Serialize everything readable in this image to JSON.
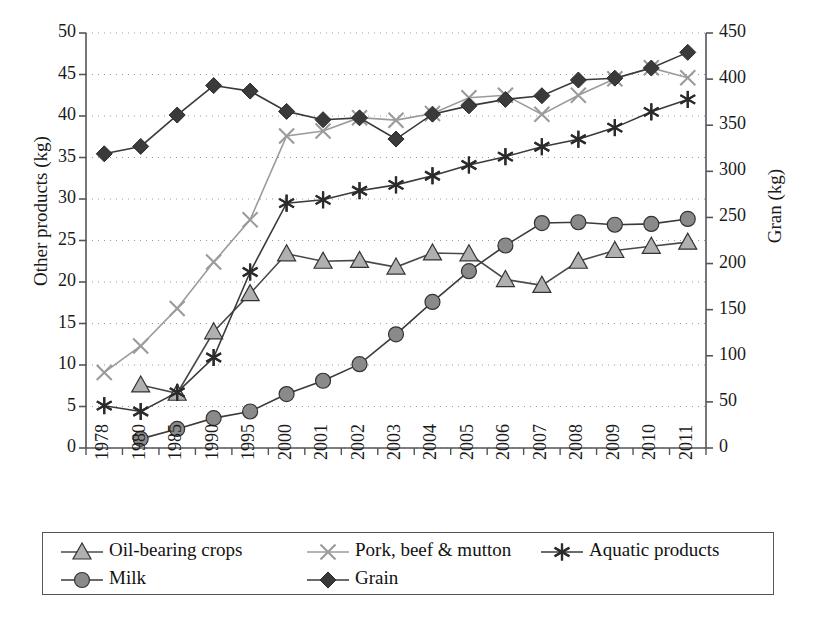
{
  "chart_data": {
    "type": "line",
    "title": "",
    "xlabel": "",
    "ylabel": "Other products (kg)",
    "y2label": "Gran (kg)",
    "ylim": [
      0,
      50
    ],
    "y2lim": [
      0,
      450
    ],
    "yticks": [
      "0",
      "5",
      "10",
      "15",
      "20",
      "25",
      "30",
      "35",
      "40",
      "45",
      "50"
    ],
    "y2ticks": [
      "0",
      "50",
      "100",
      "150",
      "200",
      "250",
      "300",
      "350",
      "400",
      "450"
    ],
    "grid": true,
    "legend_position": "bottom",
    "categories": [
      "1978",
      "1980",
      "1985",
      "1990",
      "1995",
      "2000",
      "2001",
      "2002",
      "2003",
      "2004",
      "2005",
      "2006",
      "2007",
      "2008",
      "2009",
      "2010",
      "2011"
    ],
    "series": [
      {
        "name": "Oil-bearing crops",
        "axis": "left",
        "marker": "triangle",
        "color": "#b0b0b0",
        "line_color": "#4a4a4a",
        "values": [
          null,
          7.6,
          6.6,
          14.0,
          18.6,
          23.4,
          22.5,
          22.6,
          21.8,
          23.5,
          23.4,
          20.3,
          19.6,
          22.5,
          23.8,
          24.3,
          24.8
        ]
      },
      {
        "name": "Pork, beef & mutton",
        "axis": "left",
        "marker": "x",
        "color": "#9b9b9b",
        "line_color": "#9b9b9b",
        "values": [
          9.1,
          12.3,
          16.8,
          22.4,
          27.5,
          37.6,
          38.2,
          39.8,
          39.5,
          40.3,
          42.2,
          42.5,
          40.2,
          42.5,
          44.5,
          45.8,
          44.6
        ]
      },
      {
        "name": "Aquatic products",
        "axis": "left",
        "marker": "asterisk",
        "color": "#2b2b2b",
        "line_color": "#3a3a3a",
        "values": [
          5.1,
          4.4,
          6.7,
          10.9,
          21.2,
          29.5,
          29.9,
          31.0,
          31.7,
          32.8,
          34.1,
          35.1,
          36.3,
          37.2,
          38.6,
          40.5,
          42.0
        ]
      },
      {
        "name": "Milk",
        "axis": "left",
        "marker": "circle",
        "color": "#8a8a8a",
        "line_color": "#3a3a3a",
        "values": [
          null,
          1.1,
          2.3,
          3.6,
          4.4,
          6.5,
          8.1,
          10.1,
          13.7,
          17.6,
          21.3,
          24.4,
          27.1,
          27.2,
          26.9,
          27.0,
          27.6
        ]
      },
      {
        "name": "Grain",
        "axis": "right",
        "marker": "diamond",
        "color": "#3a3a3a",
        "line_color": "#3a3a3a",
        "values": [
          319,
          327,
          361,
          393,
          387,
          365,
          356,
          358,
          335,
          362,
          371,
          378,
          382,
          399,
          401,
          412,
          429
        ]
      }
    ]
  },
  "legend": {
    "entries": [
      {
        "label": "Oil-bearing crops",
        "marker": "triangle"
      },
      {
        "label": "Pork, beef & mutton",
        "marker": "x"
      },
      {
        "label": "Aquatic products",
        "marker": "asterisk"
      },
      {
        "label": "Milk",
        "marker": "circle"
      },
      {
        "label": "Grain",
        "marker": "diamond"
      }
    ]
  }
}
